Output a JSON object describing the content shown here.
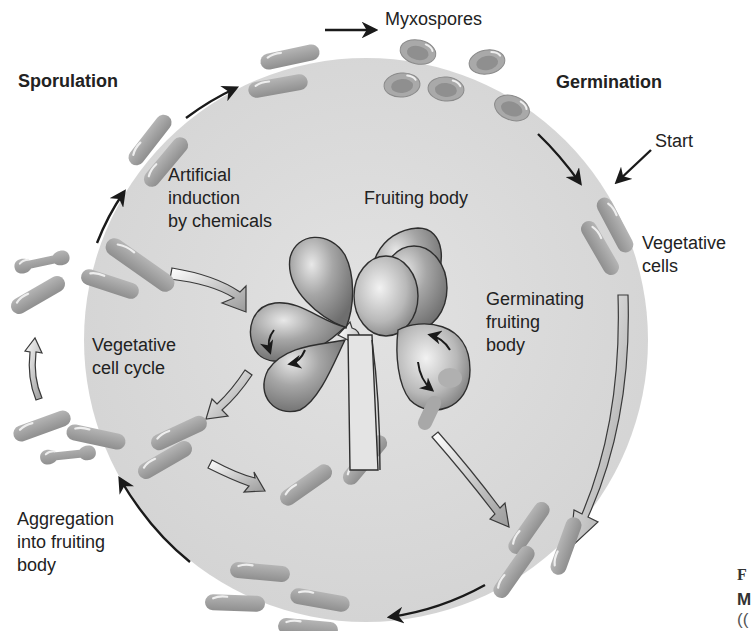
{
  "diagram": {
    "colors": {
      "background": "#ffffff",
      "disc": "#dcdcdc",
      "cell": "#a3a3a3",
      "cell_highlight": "#e6e6e6",
      "spore_outer": "#a8a8a8",
      "spore_inner": "#8e8e8e",
      "fruiting_lobe": "#9a9a9a",
      "arrow_dark": "#1a1a1a",
      "hollow_arrow_fill": "#f4f4f4"
    },
    "labels": {
      "sporulation": "Sporulation",
      "myxospores": "Myxospores",
      "germination": "Germination",
      "start": "Start",
      "vegetative_cells_1": "Vegetative",
      "vegetative_cells_2": "cells",
      "artificial_1": "Artificial",
      "artificial_2": "induction",
      "artificial_3": "by chemicals",
      "fruiting_body": "Fruiting body",
      "germinating_1": "Germinating",
      "germinating_2": "fruiting",
      "germinating_3": "body",
      "veg_cycle_1": "Vegetative",
      "veg_cycle_2": "cell cycle",
      "aggregation_1": "Aggregation",
      "aggregation_2": "into fruiting",
      "aggregation_3": "body",
      "caption_cut_1": "F",
      "caption_cut_2": "M",
      "caption_cut_3": "(("
    },
    "stages": [
      "Vegetative cells",
      "Aggregation into fruiting body",
      "Fruiting body",
      "Sporulation",
      "Myxospores",
      "Germination",
      "Germinating fruiting body",
      "Vegetative cell cycle",
      "Artificial induction by chemicals"
    ]
  }
}
